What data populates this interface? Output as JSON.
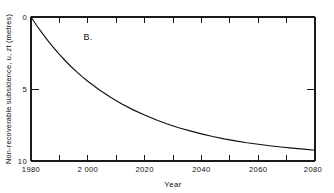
{
  "figure": {
    "panel_label": "B.",
    "background_color": "#ffffff",
    "line_color": "#111111",
    "axis_color": "#1a1a1a"
  },
  "chart_data": {
    "type": "line",
    "title": "",
    "subtitle": "",
    "xlabel": "Year",
    "ylabel": "Non-recoverable subsidence, u, zt (metres)",
    "annotations": [
      "B."
    ],
    "legend": [],
    "legend_position": "none",
    "grid": false,
    "axis_inverted_y": true,
    "xlim": [
      1980,
      2080
    ],
    "ylim": [
      0,
      10
    ],
    "xticks": [
      1980,
      1990,
      2000,
      2010,
      2020,
      2030,
      2040,
      2050,
      2060,
      2070,
      2080
    ],
    "xtick_labels": [
      "1980",
      "",
      "2 000",
      "",
      "2020",
      "",
      "2040",
      "",
      "2060",
      "",
      "2080"
    ],
    "xtick_labels_shown": [
      "1980",
      "2 000",
      "2020",
      "2040",
      "2060",
      "2080"
    ],
    "yticks": [
      0,
      5,
      10
    ],
    "ytick_labels": [
      "0",
      "5",
      "10"
    ],
    "series": [
      {
        "name": "Non-recoverable subsidence",
        "x": [
          1980,
          1982,
          1984,
          1986,
          1988,
          1990,
          1992,
          1994,
          1996,
          1998,
          2000,
          2004,
          2008,
          2012,
          2016,
          2020,
          2024,
          2028,
          2032,
          2036,
          2040,
          2044,
          2048,
          2052,
          2056,
          2060,
          2064,
          2068,
          2072,
          2076,
          2080
        ],
        "values": [
          0.0,
          0.59,
          1.14,
          1.66,
          2.14,
          2.6,
          3.02,
          3.42,
          3.79,
          4.14,
          4.46,
          5.05,
          5.57,
          6.04,
          6.45,
          6.81,
          7.14,
          7.43,
          7.69,
          7.91,
          8.12,
          8.3,
          8.46,
          8.6,
          8.73,
          8.84,
          8.94,
          9.03,
          9.11,
          9.18,
          9.25
        ]
      }
    ]
  }
}
